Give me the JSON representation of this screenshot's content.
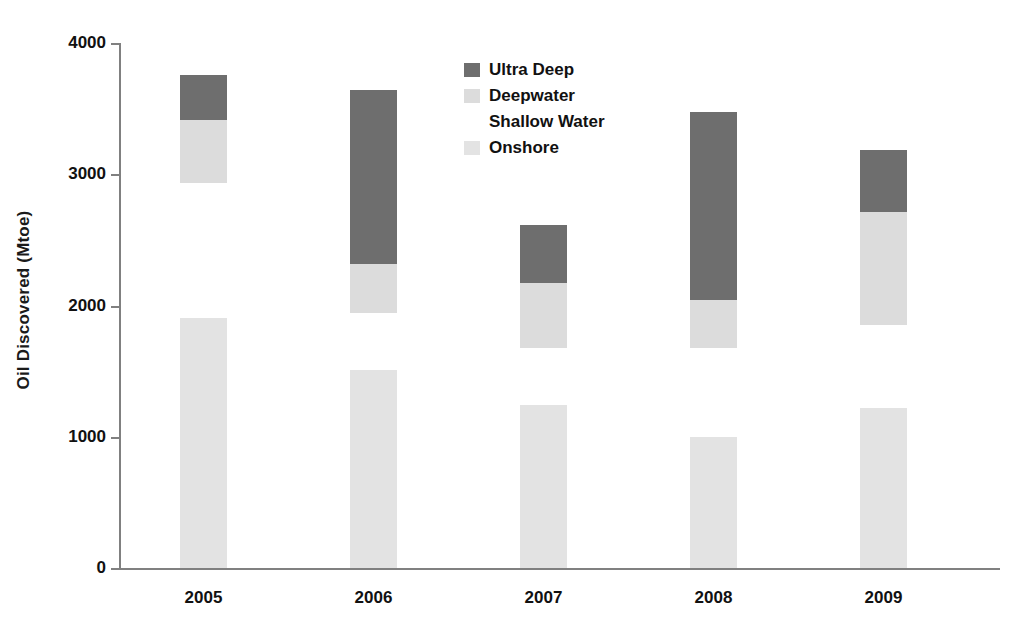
{
  "chart_data": {
    "type": "bar",
    "subtype": "stacked-bar",
    "title": "",
    "xlabel": "",
    "ylabel": "Oil Discovered (Mtoe)",
    "categories": [
      "2005",
      "2006",
      "2007",
      "2008",
      "2009"
    ],
    "ylim": [
      0,
      4000
    ],
    "yticks": [
      0,
      1000,
      2000,
      3000,
      4000
    ],
    "ytick_labels": [
      "0",
      "1000",
      "2000",
      "3000",
      "4000"
    ],
    "grid": false,
    "legend_position": "inside-top-center",
    "stack_order_bottom_to_top": [
      "Onshore",
      "Shallow Water",
      "Deepwater",
      "Ultra Deep"
    ],
    "series": [
      {
        "name": "Onshore",
        "color": "#e3e3e3",
        "values": [
          1905,
          1510,
          1240,
          1000,
          1220
        ]
      },
      {
        "name": "Shallow Water",
        "color": "#ffffff",
        "values": [
          1030,
          430,
          435,
          675,
          630
        ]
      },
      {
        "name": "Deepwater",
        "color": "#dcdcdc",
        "values": [
          480,
          380,
          495,
          365,
          860
        ]
      },
      {
        "name": "Ultra Deep",
        "color": "#6e6e6e",
        "values": [
          340,
          1320,
          445,
          1435,
          475
        ]
      }
    ],
    "cumulative_tops": {
      "Onshore": [
        1905,
        1510,
        1240,
        1000,
        1220
      ],
      "Shallow Water": [
        2935,
        1940,
        1675,
        1675,
        1850
      ],
      "Deepwater": [
        3415,
        2320,
        2170,
        2040,
        2710
      ],
      "Ultra Deep": [
        3755,
        3640,
        2615,
        3475,
        3185
      ]
    },
    "totals": [
      3755,
      3640,
      2615,
      3475,
      3185
    ]
  },
  "legend": {
    "items": [
      {
        "label": "Ultra Deep",
        "color": "#6e6e6e"
      },
      {
        "label": "Deepwater",
        "color": "#dcdcdc"
      },
      {
        "label": "Shallow Water",
        "color": "#ffffff"
      },
      {
        "label": "Onshore",
        "color": "#e3e3e3"
      }
    ]
  },
  "axis": {
    "y_title": "Oil Discovered (Mtoe)",
    "y_labels": [
      "4000",
      "3000",
      "2000",
      "1000",
      "0"
    ],
    "x_labels": [
      "2005",
      "2006",
      "2007",
      "2008",
      "2009"
    ]
  },
  "colors": {
    "axis": "#808080",
    "text": "#111111",
    "background": "#ffffff"
  }
}
